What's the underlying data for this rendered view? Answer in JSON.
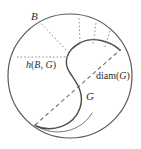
{
  "figure": {
    "title": "",
    "colors": {
      "outline": "#555555",
      "curve": "#4a4a4a",
      "dotted": "#8c8c8c",
      "dashed": "#6e6e6e",
      "text": "#2b2b2b",
      "background": "#ffffff"
    },
    "labels": {
      "ball": "B",
      "set": "G",
      "hausdorff_prefix": "h",
      "hausdorff": "h(B, G)",
      "hausdorff_open": "(",
      "hausdorff_arg1": "B",
      "hausdorff_comma": ", ",
      "hausdorff_arg2": "G",
      "hausdorff_close": ")",
      "diam_prefix": "diam",
      "diameter": "diam(G)",
      "diam_open": "(",
      "diam_arg": "G",
      "diam_close": ")"
    },
    "geometry": {
      "circle": {
        "cx": 70,
        "cy": 76,
        "r": 62
      },
      "hausdorff_segment": {
        "x1": 17,
        "y1": 57,
        "x2": 68,
        "y2": 57
      },
      "diameter_segment": {
        "x1": 35,
        "y1": 125,
        "x2": 120,
        "y2": 50
      },
      "radial_connector_count": 4
    }
  }
}
